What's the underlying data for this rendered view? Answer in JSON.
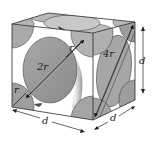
{
  "diagram": {
    "labels": {
      "radius_corner_top": "r",
      "radius_corner_left": "r",
      "face_atom_diameter": "2r",
      "face_diagonal": "4r",
      "edge_height": "d",
      "edge_front": "d",
      "edge_side": "d"
    },
    "colors": {
      "atom_face_fill": "#9a9a9a",
      "atom_light": "#c4c4c4",
      "atom_dark": "#6e6e6e",
      "edge_stroke": "#2a2a2a",
      "background": "#ffffff"
    }
  }
}
